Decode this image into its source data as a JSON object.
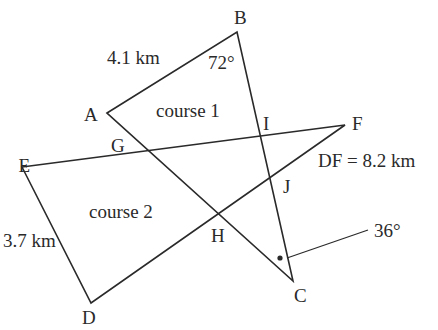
{
  "diagram": {
    "type": "geometry-orienteering-courses",
    "stroke_color": "#2a2a2a",
    "points": {
      "A": {
        "label": "A",
        "x": 107,
        "y": 113
      },
      "B": {
        "label": "B",
        "x": 237,
        "y": 32
      },
      "C": {
        "label": "C",
        "x": 293,
        "y": 281
      },
      "D": {
        "label": "D",
        "x": 91,
        "y": 303
      },
      "E": {
        "label": "E",
        "x": 22,
        "y": 167
      },
      "F": {
        "label": "F",
        "x": 345,
        "y": 125
      },
      "G": {
        "label": "G"
      },
      "H": {
        "label": "H"
      },
      "I": {
        "label": "I"
      },
      "J": {
        "label": "J"
      }
    },
    "segments": [
      [
        "A",
        "B"
      ],
      [
        "B",
        "C"
      ],
      [
        "C",
        "A"
      ],
      [
        "E",
        "F"
      ],
      [
        "F",
        "D"
      ],
      [
        "D",
        "E"
      ]
    ],
    "regions": {
      "course1": "course 1",
      "course2": "course 2"
    },
    "measurements": {
      "AB": "4.1 km",
      "DE": "3.7 km",
      "DF": "DF = 8.2 km",
      "angle_B": "72°",
      "angle_C": "36°"
    }
  }
}
